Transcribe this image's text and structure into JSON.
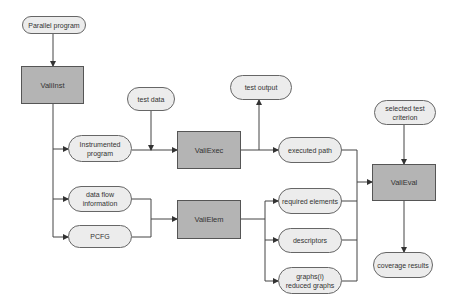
{
  "inputs": {
    "parallel_program": "Parallel program",
    "test_data": "test data",
    "selected_test_criterion": "selected test criterion"
  },
  "processes": {
    "valiinst": "ValiInst",
    "valiexec": "ValiExec",
    "valielem": "ValiElem",
    "valieval": "ValiEval"
  },
  "artifacts": {
    "instrumented_program": "Instrumented program",
    "data_flow_information": "data flow information",
    "pcfg": "PCFG",
    "test_output": "test output",
    "executed_path": "executed path",
    "required_elements": "required elements",
    "descriptors": "descriptors",
    "graphs": "graphs(i) reduced graphs",
    "coverage_results": "coverage results"
  },
  "colors": {
    "process_fill": "#b4b4b4",
    "pill_fill": "#ececec",
    "line": "#444444"
  }
}
